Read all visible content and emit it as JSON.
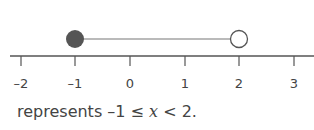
{
  "number_line": {
    "min": -2,
    "max": 3,
    "ticks": [
      "–2",
      "–1",
      "0",
      "1",
      "2",
      "3"
    ],
    "interval": {
      "start": -1,
      "end": 2,
      "start_closed": true,
      "end_closed": false
    },
    "colors": {
      "line": "#555555",
      "filled_dot": "#555555",
      "open_dot_fill": "#ffffff",
      "segment": "#777777"
    }
  },
  "caption": {
    "prefix": "represents ",
    "lower": "–1",
    "op1": " ≤ ",
    "var": "x",
    "op2": " < ",
    "upper": "2."
  }
}
